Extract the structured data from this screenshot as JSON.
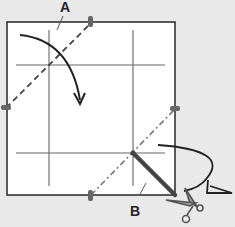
{
  "diagram": {
    "type": "origami-instruction",
    "labels": {
      "a": "A",
      "b": "B"
    },
    "colors": {
      "background": "#e9e9e9",
      "paper": "#ffffff",
      "line": "#333333",
      "crease": "#555555",
      "thick_cut": "#444444",
      "marker": "#666666"
    },
    "elements": {
      "square": "paper-square",
      "grid": "crease-grid",
      "fold_line_a": "dashed-valley-fold-line",
      "fold_line_b": "dash-dot-mountain-fold-line",
      "cut_line": "thick-cut-line",
      "fold_arrow": "curved-fold-arrow",
      "turn_arrow": "turn-over-arrow",
      "scissors": "scissors-icon"
    }
  }
}
